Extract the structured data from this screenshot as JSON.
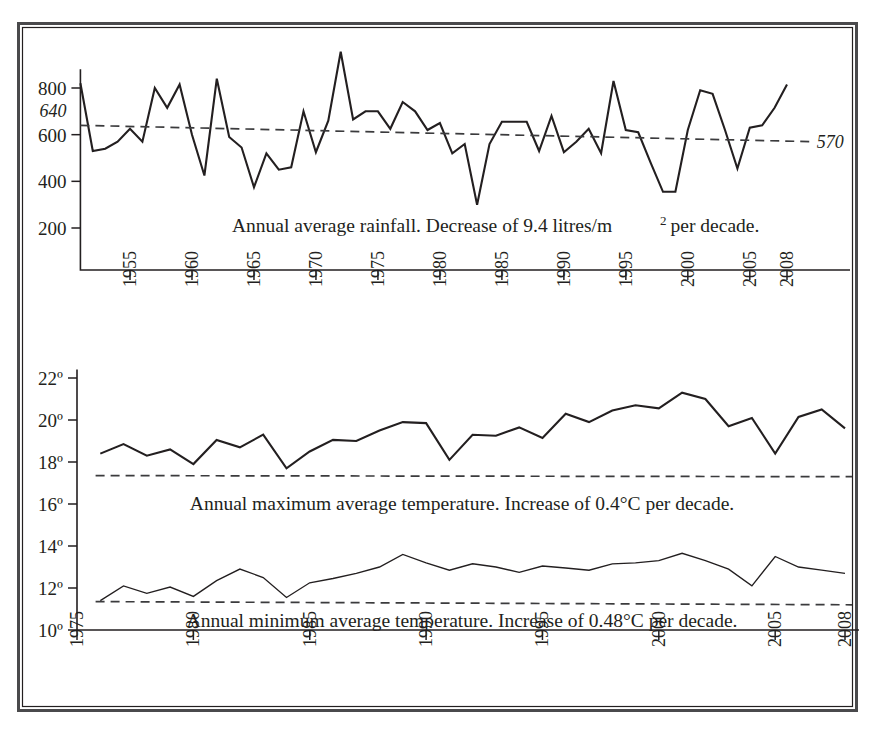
{
  "figure": {
    "title": "",
    "border_color": "#4a4a4c",
    "line_color": "#231f20",
    "background": "#ffffff"
  },
  "chart_data": [
    {
      "id": "rainfall",
      "type": "line",
      "title": "",
      "annotation": "Annual average rainfall. Decrease of 9.4 litres/m",
      "annotation_superscript": "2",
      "annotation_tail": "per decade.",
      "xlabel": "",
      "ylabel": "",
      "xlim": [
        1951,
        2013
      ],
      "ylim": [
        0,
        900
      ],
      "yticks": [
        200,
        400,
        600,
        800
      ],
      "ytick_labels": [
        "200",
        "400",
        "600",
        "800"
      ],
      "extra_ylabel": {
        "value": 640,
        "text": "640",
        "italic": true
      },
      "xticks": [
        1955,
        1960,
        1965,
        1970,
        1975,
        1980,
        1985,
        1990,
        1995,
        2000,
        2005,
        2008
      ],
      "xtick_labels": [
        "1955",
        "1960",
        "1965",
        "1970",
        "1975",
        "1980",
        "1985",
        "1990",
        "1995",
        "2000",
        "2005",
        "2008"
      ],
      "grid": false,
      "legend": "none",
      "series": [
        {
          "name": "Annual average rainfall",
          "unit": "litres/m2",
          "x": [
            1951,
            1952,
            1953,
            1954,
            1955,
            1956,
            1957,
            1958,
            1959,
            1960,
            1961,
            1962,
            1963,
            1964,
            1965,
            1966,
            1967,
            1968,
            1969,
            1970,
            1971,
            1972,
            1973,
            1974,
            1975,
            1976,
            1977,
            1978,
            1979,
            1980,
            1981,
            1982,
            1983,
            1984,
            1985,
            1986,
            1987,
            1988,
            1989,
            1990,
            1991,
            1992,
            1993,
            1994,
            1995,
            1996,
            1997,
            1998,
            1999,
            2000,
            2001,
            2002,
            2003,
            2004,
            2005,
            2006,
            2007,
            2008
          ],
          "values": [
            820,
            530,
            540,
            570,
            625,
            570,
            800,
            715,
            815,
            600,
            425,
            840,
            590,
            545,
            375,
            520,
            450,
            460,
            700,
            525,
            660,
            955,
            665,
            700,
            700,
            625,
            740,
            700,
            620,
            650,
            520,
            560,
            300,
            560,
            655,
            655,
            655,
            530,
            680,
            525,
            570,
            625,
            520,
            830,
            620,
            610,
            480,
            355,
            355,
            620,
            790,
            775,
            620,
            455,
            630,
            640,
            715,
            815
          ]
        },
        {
          "name": "Trend line (rainfall)",
          "type": "dashed-trend",
          "x": [
            1951,
            2010
          ],
          "values": [
            640,
            570
          ],
          "start_label": "640",
          "end_label": "570"
        }
      ]
    },
    {
      "id": "temperature",
      "type": "line",
      "title": "",
      "xlabel": "",
      "ylabel": "",
      "xlim": [
        1975,
        2008.5
      ],
      "ylim": [
        10,
        22.6
      ],
      "yticks": [
        10,
        12,
        14,
        16,
        18,
        20,
        22
      ],
      "ytick_labels": [
        "10º",
        "12º",
        "14º",
        "16º",
        "18º",
        "20º",
        "22º"
      ],
      "xticks": [
        1975,
        1980,
        1985,
        1990,
        1995,
        2000,
        2005,
        2008
      ],
      "xtick_labels": [
        "1975",
        "1980",
        "1985",
        "1990",
        "1995",
        "2000",
        "2005",
        "2008"
      ],
      "grid": false,
      "legend": "none",
      "annotations": [
        {
          "id": "max-annotation",
          "text": "Annual maximum average temperature. Increase of 0.4°C per decade.",
          "y": 16.0
        },
        {
          "id": "min-annotation",
          "text": "Annual minimum average temperature. Increase of 0.48°C per decade.",
          "y": 10.45
        }
      ],
      "series": [
        {
          "name": "Annual maximum average temperature",
          "unit": "°C",
          "x": [
            1976,
            1977,
            1978,
            1979,
            1980,
            1981,
            1982,
            1983,
            1984,
            1985,
            1986,
            1987,
            1988,
            1989,
            1990,
            1991,
            1992,
            1993,
            1994,
            1995,
            1996,
            1997,
            1998,
            1999,
            2000,
            2001,
            2002,
            2003,
            2004,
            2005,
            2006,
            2007,
            2008
          ],
          "values": [
            18.4,
            18.85,
            18.3,
            18.6,
            17.9,
            19.05,
            18.7,
            19.3,
            17.7,
            18.5,
            19.05,
            19.0,
            19.5,
            19.9,
            19.85,
            18.1,
            19.3,
            19.25,
            19.65,
            19.15,
            20.3,
            19.9,
            20.45,
            20.7,
            20.55,
            21.3,
            21.0,
            19.7,
            20.1,
            18.4,
            20.15,
            20.5,
            19.6
          ]
        },
        {
          "name": "Annual minimum average temperature",
          "unit": "°C",
          "x": [
            1976,
            1977,
            1978,
            1979,
            1980,
            1981,
            1982,
            1983,
            1984,
            1985,
            1986,
            1987,
            1988,
            1989,
            1990,
            1991,
            1992,
            1993,
            1994,
            1995,
            1996,
            1997,
            1998,
            1999,
            2000,
            2001,
            2002,
            2003,
            2004,
            2005,
            2006,
            2007,
            2008
          ],
          "values": [
            11.4,
            12.1,
            11.75,
            12.05,
            11.6,
            12.35,
            12.9,
            12.5,
            11.55,
            12.25,
            12.45,
            12.7,
            13.0,
            13.6,
            13.2,
            12.85,
            13.15,
            13.0,
            12.75,
            13.05,
            12.95,
            12.85,
            13.15,
            13.2,
            13.3,
            13.65,
            13.3,
            12.9,
            12.1,
            13.5,
            13.0,
            12.85,
            12.7
          ]
        },
        {
          "name": "Max temperature baseline",
          "type": "dashed-baseline",
          "x": [
            1975.8,
            2008.3
          ],
          "values": [
            17.35,
            17.3
          ]
        },
        {
          "name": "Min temperature baseline",
          "type": "dashed-baseline",
          "x": [
            1975.8,
            2008.3
          ],
          "values": [
            11.35,
            11.2
          ]
        }
      ]
    }
  ]
}
